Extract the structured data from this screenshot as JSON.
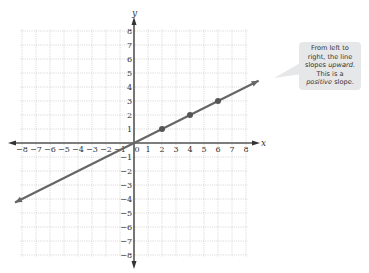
{
  "chart_data": {
    "type": "line",
    "title": "",
    "xlabel": "x",
    "ylabel": "y",
    "xlim": [
      -8,
      8
    ],
    "ylim": [
      -8,
      8
    ],
    "grid": true,
    "x_ticks": [
      -8,
      -7,
      -6,
      -5,
      -4,
      -3,
      -2,
      -1,
      0,
      1,
      2,
      3,
      4,
      5,
      6,
      7,
      8
    ],
    "y_ticks": [
      -8,
      -7,
      -6,
      -5,
      -4,
      -3,
      -2,
      -1,
      1,
      2,
      3,
      4,
      5,
      6,
      7,
      8
    ],
    "series": [
      {
        "name": "line",
        "equation": "y = x/2",
        "slope": 0.5,
        "intercept": 0,
        "x": [
          -8.5,
          8.9
        ],
        "y": [
          -4.25,
          4.45
        ],
        "color": "#666666"
      }
    ],
    "points": [
      {
        "x": 2,
        "y": 1
      },
      {
        "x": 4,
        "y": 2
      },
      {
        "x": 6,
        "y": 3
      }
    ],
    "annotations": [
      {
        "text_parts": [
          "From left to",
          "right, the line",
          "slopes ",
          "upward",
          ".",
          "This is a",
          "positive",
          " slope."
        ]
      }
    ]
  },
  "axes": {
    "x_label": "x",
    "y_label": "y",
    "origin_label": "0"
  },
  "callout": {
    "line1": "From left to",
    "line2": "right, the line",
    "line3a": "slopes ",
    "line3b": "upward",
    "line3c": ".",
    "line4": "This is a",
    "line5a": "positive",
    "line5b": " slope."
  }
}
